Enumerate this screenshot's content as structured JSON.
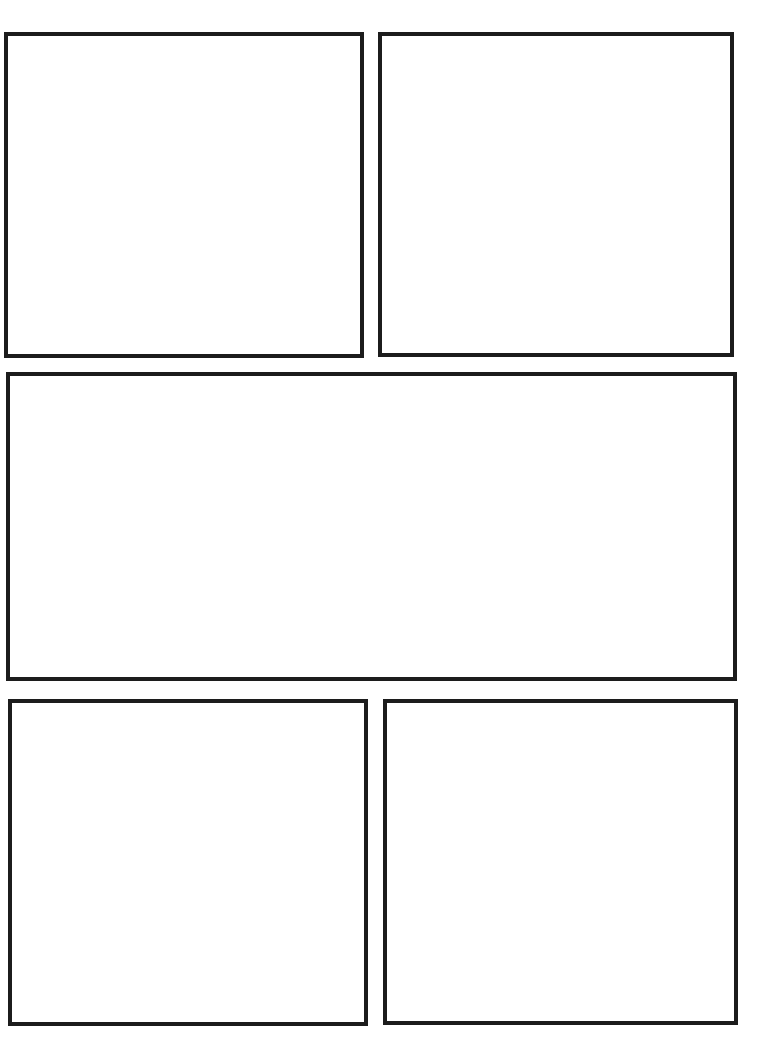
{
  "page": {
    "type": "comic-panel-template",
    "background_color": "#ffffff",
    "border_color": "#1c1c1c",
    "border_width_px": 4.5
  },
  "panels": [
    {
      "id": 1,
      "name": "panel-top-left",
      "x": 4,
      "y": 32,
      "w": 360,
      "h": 326,
      "content": ""
    },
    {
      "id": 2,
      "name": "panel-top-right",
      "x": 378,
      "y": 32,
      "w": 356,
      "h": 325,
      "content": ""
    },
    {
      "id": 3,
      "name": "panel-middle-wide",
      "x": 6,
      "y": 372,
      "w": 731,
      "h": 309,
      "content": ""
    },
    {
      "id": 4,
      "name": "panel-bottom-left",
      "x": 8,
      "y": 699,
      "w": 360,
      "h": 327,
      "content": ""
    },
    {
      "id": 5,
      "name": "panel-bottom-right",
      "x": 383,
      "y": 699,
      "w": 355,
      "h": 326,
      "content": ""
    }
  ]
}
